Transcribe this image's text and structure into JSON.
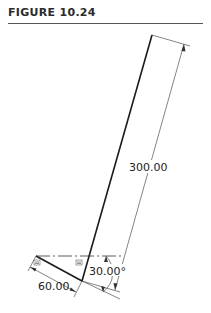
{
  "figure": {
    "title": "FIGURE 10.24"
  },
  "drawing": {
    "dimensions": {
      "length_long": "300.00",
      "length_short": "60.00",
      "angle": "30.00°"
    },
    "constraint_symbols": {
      "parallel_left": "≡",
      "parallel_right": "≡"
    },
    "colors": {
      "geometry": "#1a1a1a",
      "dimension": "#333333",
      "centerline": "#333333"
    }
  }
}
